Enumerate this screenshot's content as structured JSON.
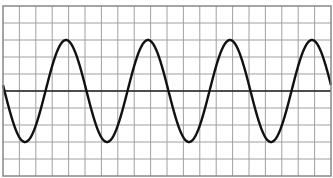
{
  "chart_data": {
    "type": "line",
    "title": "",
    "xlabel": "",
    "ylabel": "",
    "grid": true,
    "grid_columns": 20,
    "grid_rows": 10,
    "x_divisions_range": [
      0,
      20
    ],
    "y_divisions_range": [
      -5,
      5
    ],
    "waveform": {
      "shape": "sine",
      "amplitude_divisions": 3,
      "period_divisions": 5,
      "cycles_shown": 4,
      "start_phase": "zero-crossing descending",
      "peaks_x_divisions": [
        3.75,
        8.75,
        13.75,
        18.75
      ],
      "troughs_x_divisions": [
        1.25,
        6.25,
        11.25,
        16.25
      ]
    },
    "colors": {
      "background": "#ffffff",
      "grid": "#a0a0a0",
      "axis": "#222222",
      "curve": "#111111"
    }
  }
}
